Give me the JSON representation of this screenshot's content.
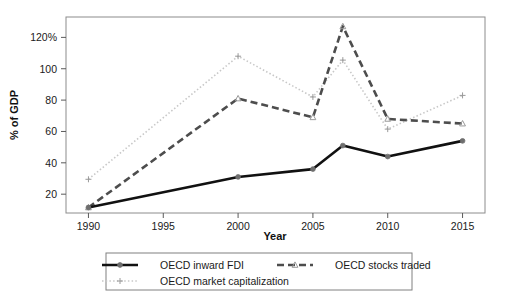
{
  "chart_data": {
    "type": "line",
    "title": "",
    "xlabel": "Year",
    "ylabel": "% of GDP",
    "x": [
      1990,
      2000,
      2005,
      2007,
      2010,
      2015
    ],
    "xlim": [
      1988.5,
      2016.5
    ],
    "ylim": [
      8,
      133
    ],
    "xticks": [
      1990,
      1995,
      2000,
      2005,
      2010,
      2015
    ],
    "xtick_labels": [
      "1990",
      "1995",
      "2000",
      "2005",
      "2010",
      "2015"
    ],
    "yticks": [
      20,
      40,
      60,
      80,
      100,
      120
    ],
    "ytick_labels": [
      "20",
      "40",
      "60",
      "80",
      "100",
      "120%"
    ],
    "grid": false,
    "legend_position": "bottom",
    "series": [
      {
        "name": "OECD inward FDI",
        "values": [
          11.5,
          31,
          36,
          51,
          44,
          54
        ],
        "color": "#111111",
        "style": "solid",
        "marker": "circle"
      },
      {
        "name": "OECD market capitalization",
        "values": [
          29.5,
          108,
          82,
          105.5,
          61.5,
          83
        ],
        "color": "#c8c8c8",
        "style": "dotted",
        "marker": "plus"
      },
      {
        "name": "OECD stocks traded",
        "values": [
          11.5,
          81,
          69,
          127,
          68,
          65
        ],
        "color": "#4d4d4d",
        "style": "dashed",
        "marker": "triangle"
      }
    ]
  },
  "legend": {
    "entries": [
      {
        "label": "OECD inward FDI"
      },
      {
        "label": "OECD stocks traded"
      },
      {
        "label": "OECD market capitalization"
      }
    ]
  }
}
